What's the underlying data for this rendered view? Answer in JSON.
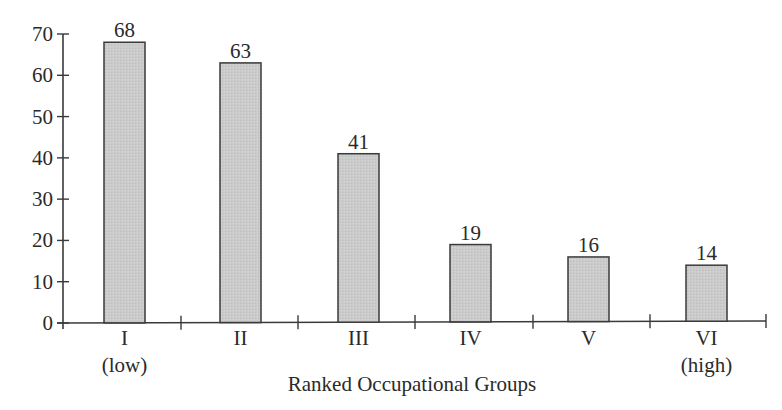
{
  "chart_data": {
    "type": "bar",
    "title": "",
    "xlabel": "Ranked Occupational Groups",
    "ylabel": "",
    "ylim": [
      0,
      70
    ],
    "yticks": [
      0,
      10,
      20,
      30,
      40,
      50,
      60,
      70
    ],
    "categories": [
      "I (low)",
      "II",
      "III",
      "IV",
      "V",
      "VI (high)"
    ],
    "category_labels": [
      {
        "line1": "I",
        "line2": "(low)"
      },
      {
        "line1": "II",
        "line2": ""
      },
      {
        "line1": "III",
        "line2": ""
      },
      {
        "line1": "IV",
        "line2": ""
      },
      {
        "line1": "V",
        "line2": ""
      },
      {
        "line1": "VI",
        "line2": "(high)"
      }
    ],
    "values": [
      68,
      63,
      41,
      19,
      16,
      14
    ],
    "value_labels": [
      "68",
      "63",
      "41",
      "19",
      "16",
      "14"
    ],
    "grid": false,
    "legend": null,
    "colors": {
      "bar_fill": "#c8c8c8",
      "bar_stroke": "#3a3a3a",
      "axis": "#3a3a3a",
      "text": "#2a2a2a"
    }
  }
}
